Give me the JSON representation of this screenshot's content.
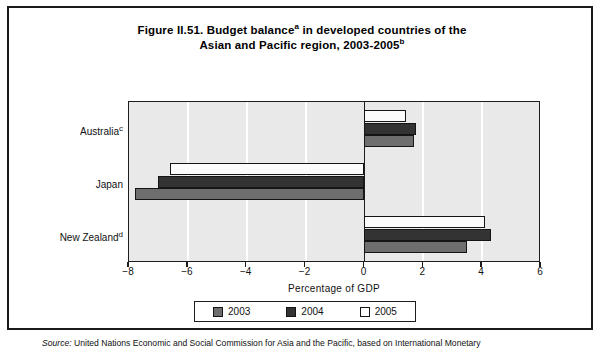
{
  "figure": {
    "title_line1": "Figure II.51. Budget balance",
    "title_sup1": "a",
    "title_line1b": " in developed countries of the",
    "title_line2": "Asian and Pacific region, 2003-2005",
    "title_sup2": "b"
  },
  "axis": {
    "x_title": "Percentage of GDP",
    "x_ticks": [
      "-8",
      "-6",
      "-4",
      "-2",
      "0",
      "2",
      "4",
      "6"
    ],
    "x_tick_values": [
      -8,
      -6,
      -4,
      -2,
      0,
      2,
      4,
      6
    ],
    "x_min": -8,
    "x_max": 6
  },
  "legend": {
    "items": [
      {
        "label": "2003",
        "color": "#6e6e6e"
      },
      {
        "label": "2004",
        "color": "#333333"
      },
      {
        "label": "2005",
        "color": "#ffffff"
      }
    ]
  },
  "categories": [
    {
      "label": "Australia",
      "sup": "c"
    },
    {
      "label": "Japan",
      "sup": ""
    },
    {
      "label": "New Zealand",
      "sup": "d"
    }
  ],
  "source": {
    "label": "Source:",
    "text": "United Nations Economic and Social Commission for Asia and the Pacific, based on International Monetary"
  },
  "chart_data": {
    "type": "bar",
    "orientation": "horizontal",
    "xlabel": "Percentage of GDP",
    "ylabel": "",
    "xlim": [
      -8,
      6
    ],
    "xticks": [
      -8,
      -6,
      -4,
      -2,
      0,
      2,
      4,
      6
    ],
    "grid": true,
    "legend_position": "bottom",
    "categories": [
      "Australia",
      "Japan",
      "New Zealand"
    ],
    "series": [
      {
        "name": "2003",
        "color": "#6e6e6e",
        "values": [
          1.7,
          -7.8,
          3.5
        ]
      },
      {
        "name": "2004",
        "color": "#333333",
        "values": [
          1.75,
          -7.0,
          4.3
        ]
      },
      {
        "name": "2005",
        "color": "#ffffff",
        "values": [
          1.4,
          -6.6,
          4.1
        ]
      }
    ]
  }
}
